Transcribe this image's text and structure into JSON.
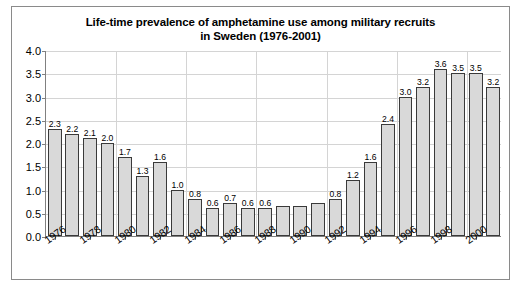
{
  "chart_data": {
    "type": "bar",
    "title": "Life-time prevalence of amphetamine use among military recruits in Sweden (1976-2001)",
    "title_line1": "Life-time prevalence of amphetamine use among military recruits",
    "title_line2": "in Sweden (1976-2001)",
    "xlabel": "",
    "ylabel": "",
    "ylim": [
      0.0,
      4.0
    ],
    "ytick_labels": [
      "0.0",
      "0.5",
      "1.0",
      "1.5",
      "2.0",
      "2.5",
      "3.0",
      "3.5",
      "4.0"
    ],
    "ytick_values": [
      0.0,
      0.5,
      1.0,
      1.5,
      2.0,
      2.5,
      3.0,
      3.5,
      4.0
    ],
    "grid": true,
    "legend": "none",
    "categories": [
      "1976",
      "1977",
      "1978",
      "1979",
      "1980",
      "1981",
      "1982",
      "1983",
      "1984",
      "1985",
      "1986",
      "1987",
      "1988",
      "1989",
      "1990",
      "1991",
      "1992",
      "1993",
      "1994",
      "1995",
      "1996",
      "1997",
      "1998",
      "1999",
      "2000",
      "2001"
    ],
    "xtick_labels_shown": [
      "1976",
      "1978",
      "1980",
      "1982",
      "1984",
      "1986",
      "1988",
      "1990",
      "1992",
      "1994",
      "1996",
      "1998",
      "2000"
    ],
    "values": [
      2.3,
      2.2,
      2.1,
      2.0,
      1.7,
      1.3,
      1.6,
      1.0,
      0.8,
      0.6,
      0.7,
      0.6,
      0.6,
      0.65,
      0.65,
      0.7,
      0.8,
      1.2,
      1.6,
      2.4,
      3.0,
      3.2,
      3.6,
      3.5,
      3.5,
      3.2
    ],
    "data_labels": [
      "2.3",
      "2.2",
      "2.1",
      "2.0",
      "1.7",
      "1.3",
      "1.6",
      "1.0",
      "0.8",
      "0.6",
      "0.7",
      "0.6",
      "0.6",
      "",
      "",
      "",
      "0.8",
      "1.2",
      "1.6",
      "2.4",
      "3.0",
      "3.2",
      "3.6",
      "3.5",
      "3.5",
      "3.2"
    ],
    "bar_fill_color": "#d9d9d9",
    "bar_edge_color": "#3a3a3a",
    "grid_color": "#d4d4d4",
    "axis_color": "#808080",
    "background_color": "#ffffff"
  }
}
